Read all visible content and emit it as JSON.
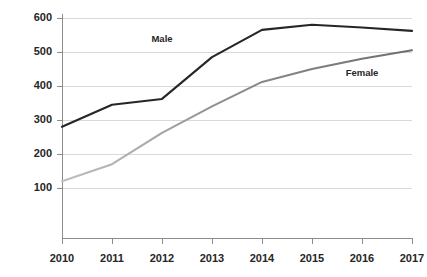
{
  "chart_data": {
    "type": "line",
    "title": "",
    "subtitle": "",
    "xlabel": "",
    "ylabel": "",
    "categories": [
      "2010",
      "2011",
      "2012",
      "2013",
      "2014",
      "2015",
      "2016",
      "2017"
    ],
    "x": [
      2010,
      2011,
      2012,
      2013,
      2014,
      2015,
      2016,
      2017
    ],
    "xlim": [
      2010,
      2017
    ],
    "ylim": [
      0,
      600
    ],
    "y_ticks": [
      100,
      200,
      300,
      400,
      500,
      600
    ],
    "y_tick_labels": [
      "100",
      "200",
      "300",
      "400",
      "500",
      "600"
    ],
    "x_ticks": [
      2010,
      2011,
      2012,
      2013,
      2014,
      2015,
      2016,
      2017
    ],
    "x_tick_labels": [
      "2010",
      "2011",
      "2012",
      "2013",
      "2014",
      "2015",
      "2016",
      "2017"
    ],
    "grid": "horizontal",
    "legend_position": "inline-annotation",
    "series": [
      {
        "name": "Male",
        "color": "#262626",
        "values": [
          280,
          345,
          362,
          485,
          565,
          580,
          572,
          562
        ],
        "label_text": "Male",
        "label_x": 2012,
        "label_y": 540
      },
      {
        "name": "Female",
        "color": "#a6a6a6",
        "color_end": "#6e6e6e",
        "values": [
          120,
          170,
          262,
          340,
          412,
          450,
          480,
          505
        ],
        "label_text": "Female",
        "label_x": 2016,
        "label_y": 440
      }
    ],
    "annotations": [
      {
        "text": "Male",
        "series": "Male"
      },
      {
        "text": "Female",
        "series": "Female"
      }
    ]
  },
  "axes": {
    "y_labels": [
      "600",
      "500",
      "400",
      "300",
      "200",
      "100"
    ],
    "x_labels": [
      "2010",
      "2011",
      "2012",
      "2013",
      "2014",
      "2015",
      "2016",
      "2017"
    ]
  },
  "colors": {
    "background": "#ffffff",
    "gridline": "#d9d9d9",
    "axis": "#8c8c8c",
    "text": "#262626",
    "male_line": "#262626",
    "female_line_start": "#a6a6a6",
    "female_line_end": "#6e6e6e"
  }
}
